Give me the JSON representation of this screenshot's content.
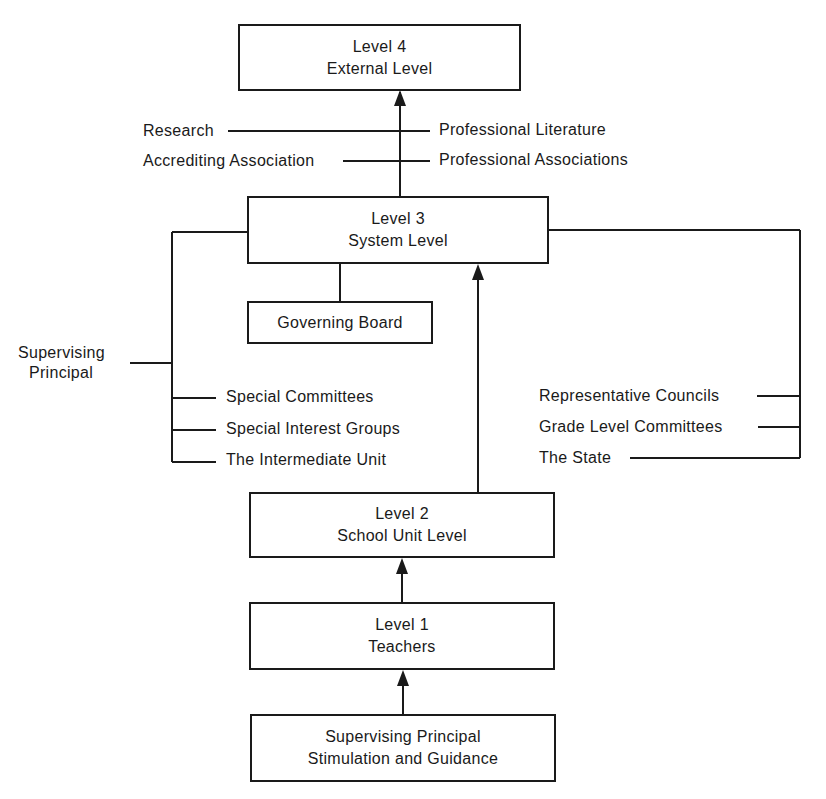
{
  "diagram": {
    "type": "flowchart",
    "boxes": {
      "level4": {
        "line1": "Level 4",
        "line2": "External Level"
      },
      "level3": {
        "line1": "Level 3",
        "line2": "System Level"
      },
      "governing_board": {
        "line1": "Governing Board"
      },
      "level2": {
        "line1": "Level 2",
        "line2": "School Unit Level"
      },
      "level1": {
        "line1": "Level 1",
        "line2": "Teachers"
      },
      "principal": {
        "line1": "Supervising Principal",
        "line2": "Stimulation and Guidance"
      }
    },
    "external_influences": {
      "left": [
        "Research",
        "Accrediting Association"
      ],
      "right": [
        "Professional Literature",
        "Professional Associations"
      ]
    },
    "system_left": {
      "side_label_line1": "Supervising",
      "side_label_line2": "Principal",
      "items": [
        "Special Committees",
        "Special Interest Groups",
        "The Intermediate Unit"
      ]
    },
    "system_right": {
      "items": [
        "Representative Councils",
        "Grade Level Committees",
        "The State"
      ]
    },
    "colors": {
      "line": "#1a1a1a",
      "background": "#ffffff"
    }
  }
}
